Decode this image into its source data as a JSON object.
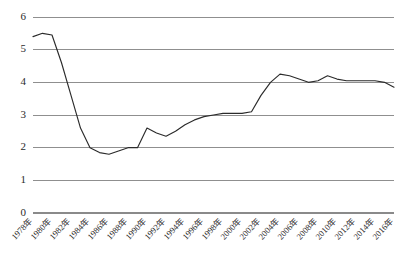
{
  "chart_data": {
    "type": "line",
    "title": "",
    "subtitle": "",
    "xlabel": "",
    "ylabel": "",
    "ylim": [
      0,
      6
    ],
    "ytick_values": [
      0,
      1,
      2,
      3,
      4,
      5,
      6
    ],
    "ytick_labels": [
      "0",
      "1",
      "2",
      "3",
      "4",
      "5",
      "6"
    ],
    "xlim": [
      1978,
      2016
    ],
    "xtick_labels": [
      "1978年",
      "1980年",
      "1982年",
      "1984年",
      "1986年",
      "1988年",
      "1990年",
      "1992年",
      "1994年",
      "1996年",
      "1998年",
      "2000年",
      "2002年",
      "2004年",
      "2006年",
      "2008年",
      "2010年",
      "2012年",
      "2014年",
      "2016年"
    ],
    "xtick_values": [
      1978,
      1980,
      1982,
      1984,
      1986,
      1988,
      1990,
      1992,
      1994,
      1996,
      1998,
      2000,
      2002,
      2004,
      2006,
      2008,
      2010,
      2012,
      2014,
      2016
    ],
    "grid": true,
    "grid_axis": "y",
    "legend": false,
    "legend_position": "none",
    "line_color": "#2b2b2b",
    "grid_color": "#8f8f8f",
    "background_color": "#ffffff",
    "x": [
      1978,
      1979,
      1980,
      1981,
      1982,
      1983,
      1984,
      1985,
      1986,
      1987,
      1988,
      1989,
      1990,
      1991,
      1992,
      1993,
      1994,
      1995,
      1996,
      1997,
      1998,
      1999,
      2000,
      2001,
      2002,
      2003,
      2004,
      2005,
      2006,
      2007,
      2008,
      2009,
      2010,
      2011,
      2012,
      2013,
      2014,
      2015,
      2016
    ],
    "series": [
      {
        "name": "",
        "values": [
          5.4,
          5.5,
          5.45,
          4.6,
          3.6,
          2.6,
          2.0,
          1.85,
          1.8,
          1.9,
          2.0,
          2.0,
          2.6,
          2.45,
          2.35,
          2.5,
          2.7,
          2.85,
          2.95,
          3.0,
          3.05,
          3.05,
          3.05,
          3.1,
          3.6,
          4.0,
          4.25,
          4.2,
          4.1,
          4.0,
          4.05,
          4.2,
          4.1,
          4.05,
          4.05,
          4.05,
          4.05,
          4.0,
          3.85
        ]
      }
    ]
  }
}
